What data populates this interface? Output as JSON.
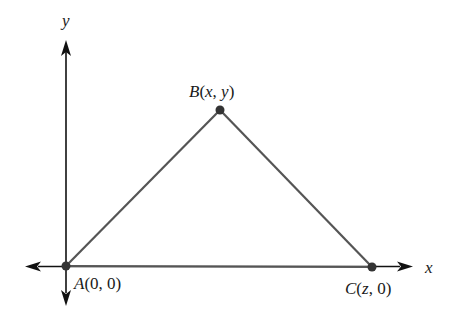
{
  "diagram": {
    "type": "coordinate-triangle",
    "axes": {
      "x_label": "x",
      "y_label": "y"
    },
    "points": [
      {
        "id": "A",
        "name": "A",
        "coords": "(0, 0)",
        "label_parts": {
          "name": "A",
          "open": "(",
          "a": "0",
          "sep": ", ",
          "b": "0",
          "close": ")"
        }
      },
      {
        "id": "B",
        "name": "B",
        "coords": "(x, y)",
        "label_parts": {
          "name": "B",
          "open": "(",
          "a": "x",
          "sep": ", ",
          "b": "y",
          "close": ")"
        }
      },
      {
        "id": "C",
        "name": "C",
        "coords": "(z, 0)",
        "label_parts": {
          "name": "C",
          "open": "(",
          "a": "z",
          "sep": ", ",
          "b": "0",
          "close": ")"
        }
      }
    ],
    "colors": {
      "axis": "#111111",
      "triangle": "#555555",
      "point": "#333333"
    }
  }
}
